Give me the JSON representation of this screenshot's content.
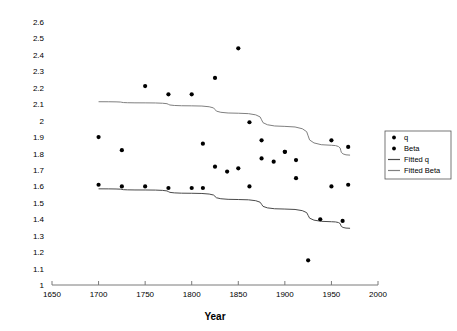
{
  "chart_data": {
    "type": "scatter",
    "title": "",
    "xlabel": "Year",
    "ylabel": "",
    "xlim": [
      1650,
      2000
    ],
    "ylim": [
      1,
      2.6
    ],
    "grid": false,
    "legend_position": "right",
    "xticks": [
      1650,
      1700,
      1750,
      1800,
      1850,
      1900,
      1950,
      2000
    ],
    "xtick_labels": [
      "1650",
      "1700",
      "1750",
      "1800",
      "1850",
      "1900",
      "1950",
      "2000"
    ],
    "yticks": [
      1,
      1.1,
      1.2,
      1.3,
      1.4,
      1.5,
      1.6,
      1.7,
      1.8,
      1.9,
      2,
      2.1,
      2.2,
      2.3,
      2.4,
      2.5,
      2.6
    ],
    "ytick_labels": [
      "1",
      "1.1",
      "1.2",
      "1.3",
      "1.4",
      "1.5",
      "1.6",
      "1.7",
      "1.8",
      "1.9",
      "2",
      "2.1",
      "2.2",
      "2.3",
      "2.4",
      "2.5",
      "2.6"
    ],
    "series": [
      {
        "name": "q",
        "type": "scatter",
        "marker": "dot",
        "color": "#000000",
        "points": [
          {
            "x": 1700,
            "y": 1.61
          },
          {
            "x": 1725,
            "y": 1.6
          },
          {
            "x": 1750,
            "y": 1.6
          },
          {
            "x": 1775,
            "y": 1.59
          },
          {
            "x": 1800,
            "y": 1.59
          },
          {
            "x": 1812,
            "y": 1.59
          },
          {
            "x": 1825,
            "y": 1.72
          },
          {
            "x": 1838,
            "y": 1.69
          },
          {
            "x": 1850,
            "y": 1.71
          },
          {
            "x": 1862,
            "y": 1.6
          },
          {
            "x": 1875,
            "y": 1.77
          },
          {
            "x": 1888,
            "y": 1.75
          },
          {
            "x": 1900,
            "y": 1.81
          },
          {
            "x": 1912,
            "y": 1.65
          },
          {
            "x": 1925,
            "y": 1.15
          },
          {
            "x": 1938,
            "y": 1.4
          },
          {
            "x": 1950,
            "y": 1.6
          },
          {
            "x": 1962,
            "y": 1.39
          },
          {
            "x": 1968,
            "y": 1.61
          }
        ]
      },
      {
        "name": "Beta",
        "type": "scatter",
        "marker": "dot",
        "color": "#000000",
        "points": [
          {
            "x": 1700,
            "y": 1.9
          },
          {
            "x": 1725,
            "y": 1.82
          },
          {
            "x": 1750,
            "y": 2.21
          },
          {
            "x": 1775,
            "y": 2.16
          },
          {
            "x": 1800,
            "y": 2.16
          },
          {
            "x": 1812,
            "y": 1.86
          },
          {
            "x": 1825,
            "y": 2.26
          },
          {
            "x": 1850,
            "y": 2.44
          },
          {
            "x": 1862,
            "y": 1.99
          },
          {
            "x": 1875,
            "y": 1.88
          },
          {
            "x": 1900,
            "y": 1.81
          },
          {
            "x": 1912,
            "y": 1.76
          },
          {
            "x": 1950,
            "y": 1.88
          },
          {
            "x": 1968,
            "y": 1.84
          }
        ]
      },
      {
        "name": "Fitted q",
        "type": "line",
        "color": "#4a4a4a",
        "points": [
          {
            "x": 1700,
            "y": 1.585
          },
          {
            "x": 1750,
            "y": 1.578
          },
          {
            "x": 1800,
            "y": 1.558
          },
          {
            "x": 1850,
            "y": 1.52
          },
          {
            "x": 1900,
            "y": 1.462
          },
          {
            "x": 1950,
            "y": 1.385
          },
          {
            "x": 1970,
            "y": 1.345
          }
        ]
      },
      {
        "name": "Fitted Beta",
        "type": "line",
        "color": "#808080",
        "points": [
          {
            "x": 1700,
            "y": 2.115
          },
          {
            "x": 1750,
            "y": 2.108
          },
          {
            "x": 1800,
            "y": 2.09
          },
          {
            "x": 1850,
            "y": 2.045
          },
          {
            "x": 1900,
            "y": 1.965
          },
          {
            "x": 1950,
            "y": 1.85
          },
          {
            "x": 1970,
            "y": 1.79
          }
        ]
      }
    ]
  },
  "legend": {
    "entries": [
      {
        "label": "q",
        "kind": "marker",
        "color": "#000000"
      },
      {
        "label": "Beta",
        "kind": "marker",
        "color": "#000000"
      },
      {
        "label": "Fitted q",
        "kind": "line",
        "color": "#4a4a4a"
      },
      {
        "label": "Fitted Beta",
        "kind": "line",
        "color": "#808080"
      }
    ]
  },
  "axes": {
    "x_title": "Year"
  }
}
